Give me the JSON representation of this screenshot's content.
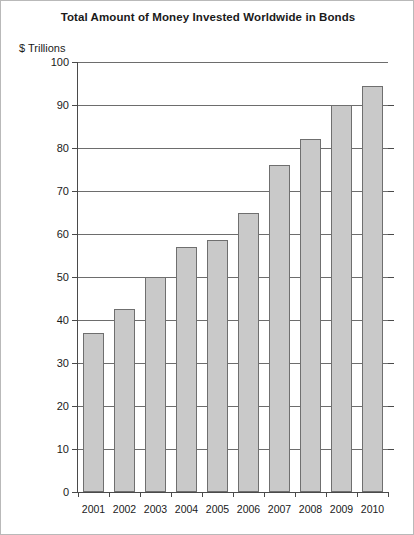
{
  "figure": {
    "frame_color": "#b9b9b9",
    "background": "#ffffff"
  },
  "chart_data": {
    "type": "bar",
    "title": "Total Amount of Money Invested Worldwide in Bonds",
    "subtitle": "",
    "xlabel": "",
    "ylabel": "$ Trillions",
    "categories": [
      "2001",
      "2002",
      "2003",
      "2004",
      "2005",
      "2006",
      "2007",
      "2008",
      "2009",
      "2010"
    ],
    "values": [
      37,
      42.5,
      50,
      57,
      58.5,
      65,
      76,
      82,
      90,
      94.5
    ],
    "ylim": [
      0,
      100
    ],
    "ytick_values": [
      0,
      10,
      20,
      30,
      40,
      50,
      60,
      70,
      80,
      90,
      100
    ],
    "ytick_labels": [
      "0",
      "10",
      "20",
      "30",
      "40",
      "50",
      "60",
      "70",
      "80",
      "90",
      "100"
    ],
    "grid": true,
    "grid_axis": "y",
    "legend": false,
    "legend_position": "none",
    "bar_fill_color": "#c9c9c9",
    "bar_border_color": "#6f6f6f",
    "axis_color": "#4a4a4a",
    "grid_color": "#6d6d6d",
    "text_color": "#1a1a1a"
  }
}
